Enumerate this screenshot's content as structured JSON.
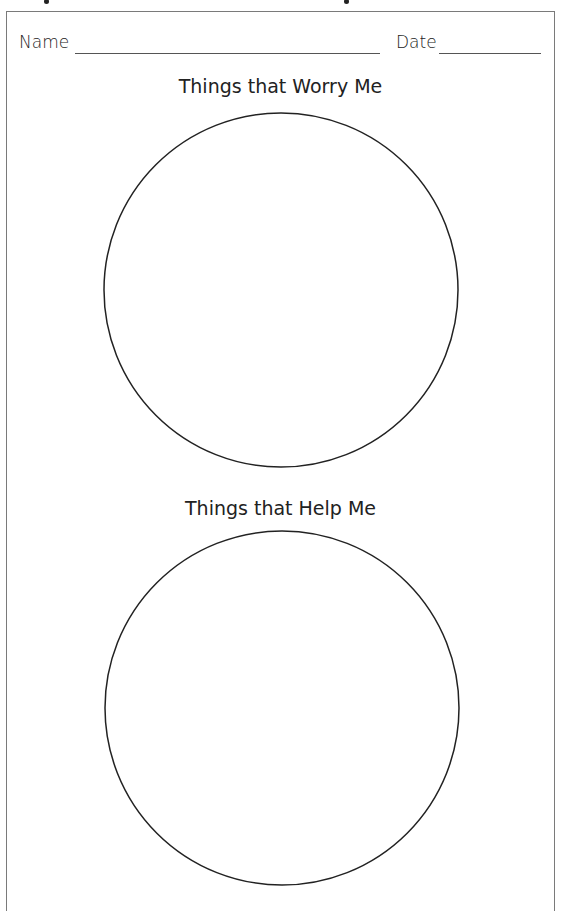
{
  "header": {
    "name_label": "Name",
    "date_label": "Date"
  },
  "sections": [
    {
      "title": "Things that Worry Me"
    },
    {
      "title": "Things that Help Me"
    }
  ],
  "colors": {
    "border": "#7a7a7a",
    "ink": "#222222"
  }
}
